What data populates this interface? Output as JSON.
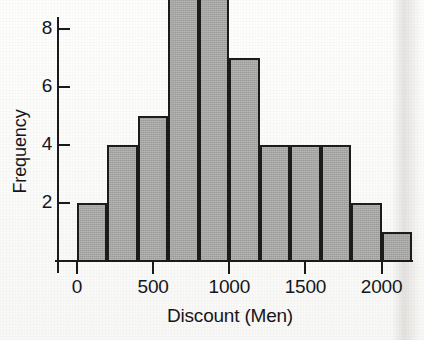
{
  "chart_data": {
    "type": "bar",
    "title": "",
    "subtitle": "",
    "xlabel": "Discount (Men)",
    "ylabel": "Frequency",
    "bin_width": 200,
    "bin_edges": [
      0,
      200,
      400,
      600,
      800,
      1000,
      1200,
      1400,
      1600,
      1800,
      2000,
      2200
    ],
    "categories": [
      "0-200",
      "200-400",
      "400-600",
      "600-800",
      "800-1000",
      "1000-1200",
      "1200-1400",
      "1400-1600",
      "1600-1800",
      "1800-2000",
      "2000-2200"
    ],
    "values": [
      2,
      4,
      5,
      10,
      11,
      7,
      4,
      4,
      4,
      2,
      1
    ],
    "xlim": [
      0,
      2200
    ],
    "ylim": [
      0,
      11.6
    ],
    "x_ticks": [
      0,
      500,
      1000,
      1500,
      2000
    ],
    "x_tick_labels": [
      "0",
      "500",
      "1000",
      "1500",
      "2000"
    ],
    "y_ticks": [
      2,
      4,
      6,
      8,
      10
    ],
    "y_tick_labels": [
      "2",
      "4",
      "6",
      "8",
      "10"
    ],
    "grid": false,
    "legend": false,
    "legend_position": "none",
    "bar_fill_color": "#a2a2a0",
    "bar_edge_color": "#1c1c1c",
    "axis_color": "#1a1a1a",
    "background_color": "#fdfdfc",
    "total_count": 54
  },
  "axes": {
    "y_title": "Frequency",
    "x_title": "Discount (Men)"
  }
}
